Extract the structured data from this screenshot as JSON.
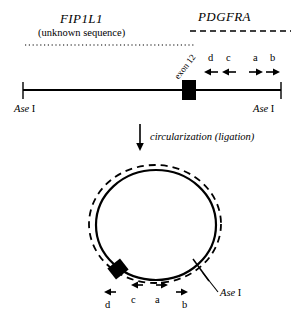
{
  "figure": {
    "linear_map": {
      "gene_left": "FIP1L1",
      "gene_left_note": "(unknown sequence)",
      "gene_right": "PDGFRA",
      "exon_label": "exon 12",
      "enzyme_left_italic": "Ase",
      "enzyme_left_roman": "I",
      "enzyme_right_italic": "Ase",
      "enzyme_right_roman": "I",
      "primers": [
        {
          "label": "d",
          "direction": "left"
        },
        {
          "label": "c",
          "direction": "left"
        },
        {
          "label": "a",
          "direction": "right"
        },
        {
          "label": "b",
          "direction": "right"
        }
      ]
    },
    "transition": {
      "label": "circularization (ligation)"
    },
    "circular_map": {
      "enzyme_italic": "Ase",
      "enzyme_roman": "I",
      "primers": [
        {
          "label": "d",
          "direction": "left"
        },
        {
          "label": "c",
          "direction": "left"
        },
        {
          "label": "a",
          "direction": "right"
        },
        {
          "label": "b",
          "direction": "right"
        }
      ]
    },
    "colors": {
      "ink": "#000000",
      "background": "#ffffff"
    }
  }
}
